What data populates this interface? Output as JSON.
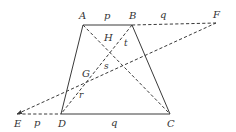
{
  "diagram": {
    "title": "",
    "points": {
      "A": {
        "x": 83,
        "y": 25
      },
      "B": {
        "x": 132,
        "y": 25
      },
      "C": {
        "x": 170,
        "y": 114
      },
      "D": {
        "x": 61,
        "y": 114
      },
      "E": {
        "x": 17,
        "y": 114
      },
      "F": {
        "x": 216,
        "y": 23
      }
    },
    "segments": [
      {
        "id": "AB",
        "from": "A",
        "to": "B",
        "style": "solid"
      },
      {
        "id": "BC",
        "from": "B",
        "to": "C",
        "style": "solid"
      },
      {
        "id": "DC",
        "from": "D",
        "to": "C",
        "style": "solid"
      },
      {
        "id": "AD",
        "from": "A",
        "to": "D",
        "style": "solid"
      },
      {
        "id": "BF",
        "from": "B",
        "to": "F",
        "style": "dashed"
      },
      {
        "id": "ED",
        "from": "E",
        "to": "D",
        "style": "dashed"
      },
      {
        "id": "AC",
        "from": "A",
        "to": "C",
        "style": "dashed"
      },
      {
        "id": "BD",
        "from": "B",
        "to": "D",
        "style": "dashed"
      },
      {
        "id": "EF",
        "from": "E",
        "to": "F",
        "style": "dashed"
      }
    ],
    "labels": [
      {
        "id": "label-A",
        "text": "A",
        "x": 79,
        "y": 19
      },
      {
        "id": "label-B",
        "text": "B",
        "x": 129,
        "y": 19
      },
      {
        "id": "label-F",
        "text": "F",
        "x": 213,
        "y": 18
      },
      {
        "id": "label-E",
        "text": "E",
        "x": 14,
        "y": 127
      },
      {
        "id": "label-D",
        "text": "D",
        "x": 58,
        "y": 127
      },
      {
        "id": "label-C",
        "text": "C",
        "x": 167,
        "y": 127
      },
      {
        "id": "label-p-top",
        "text": "p",
        "x": 104,
        "y": 19
      },
      {
        "id": "label-q-top",
        "text": "q",
        "x": 160,
        "y": 18
      },
      {
        "id": "label-p-bottom",
        "text": "p",
        "x": 34,
        "y": 126
      },
      {
        "id": "label-q-bottom",
        "text": "q",
        "x": 111,
        "y": 126
      },
      {
        "id": "label-H",
        "text": "H",
        "x": 104,
        "y": 41
      },
      {
        "id": "label-t",
        "text": "t",
        "x": 124,
        "y": 46,
        "small": true
      },
      {
        "id": "label-G",
        "text": "G",
        "x": 82,
        "y": 77
      },
      {
        "id": "label-s",
        "text": "s",
        "x": 104,
        "y": 69,
        "small": true
      },
      {
        "id": "label-r",
        "text": "r",
        "x": 79,
        "y": 98,
        "small": true
      }
    ],
    "arrowheads": [
      {
        "id": "arrow-E",
        "at": "E",
        "from": "F"
      }
    ]
  }
}
